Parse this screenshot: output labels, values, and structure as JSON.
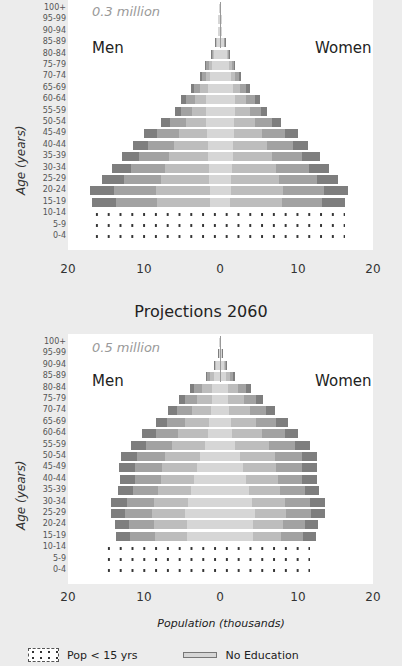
{
  "chart_data": [
    {
      "type": "bar",
      "subtype": "population-pyramid",
      "title": "",
      "scale_note": "0.3 million",
      "left_label": "Men",
      "right_label": "Women",
      "ylabel": "Age (years)",
      "xlabel": "",
      "xlim": [
        -20,
        20
      ],
      "x_ticks": [
        "20",
        "10",
        "0",
        "10",
        "20"
      ],
      "categories": [
        "100+",
        "95-99",
        "90-94",
        "85-89",
        "80-84",
        "75-79",
        "70-74",
        "65-69",
        "60-64",
        "55-59",
        "50-54",
        "45-49",
        "40-44",
        "35-39",
        "30-34",
        "25-29",
        "20-24",
        "15-19",
        "10-14",
        "5-9",
        "0-4"
      ],
      "series": [
        {
          "name": "Men (total)",
          "values": [
            0.1,
            0.2,
            0.3,
            0.7,
            1.2,
            2.0,
            2.6,
            3.8,
            5.1,
            5.9,
            7.8,
            10.0,
            11.4,
            12.9,
            14.2,
            15.5,
            17.1,
            16.8,
            17.0,
            17.0,
            17.0
          ]
        },
        {
          "name": "Women (total)",
          "values": [
            0.1,
            0.2,
            0.3,
            0.7,
            1.3,
            2.0,
            2.7,
            3.9,
            5.3,
            6.2,
            8.0,
            10.2,
            11.6,
            13.1,
            14.3,
            15.5,
            16.8,
            16.4,
            16.4,
            16.4,
            16.4
          ]
        },
        {
          "name": "Men No Education",
          "values": [
            0.1,
            0.2,
            0.3,
            0.5,
            0.8,
            1.1,
            1.3,
            1.6,
            1.9,
            1.9,
            1.8,
            1.7,
            1.6,
            1.6,
            1.5,
            1.4,
            1.3,
            1.3,
            0,
            0,
            0
          ]
        },
        {
          "name": "Women No Education",
          "values": [
            0.1,
            0.2,
            0.3,
            0.5,
            0.9,
            1.2,
            1.4,
            1.7,
            2.0,
            2.0,
            1.9,
            1.8,
            1.7,
            1.7,
            1.6,
            1.5,
            1.4,
            1.3,
            0,
            0,
            0
          ]
        }
      ],
      "pop_under_15_pattern": "dotted"
    },
    {
      "type": "bar",
      "subtype": "population-pyramid",
      "title": "Projections 2060",
      "scale_note": "0.5 million",
      "left_label": "Men",
      "right_label": "Women",
      "ylabel": "Age (years)",
      "xlabel": "Population (thousands)",
      "xlim": [
        -20,
        20
      ],
      "x_ticks": [
        "20",
        "10",
        "0",
        "10",
        "20"
      ],
      "categories": [
        "100+",
        "95-99",
        "90-94",
        "85-89",
        "80-84",
        "75-79",
        "70-74",
        "65-69",
        "60-64",
        "55-59",
        "50-54",
        "45-49",
        "40-44",
        "35-39",
        "30-34",
        "25-29",
        "20-24",
        "15-19",
        "10-14",
        "5-9",
        "0-4"
      ],
      "series": [
        {
          "name": "Men (total)",
          "values": [
            0.1,
            0.3,
            0.8,
            1.9,
            4.0,
            5.4,
            6.8,
            8.4,
            10.2,
            11.7,
            13.0,
            13.3,
            13.2,
            13.4,
            14.3,
            14.4,
            13.8,
            13.7,
            15.4,
            15.2,
            15.0
          ]
        },
        {
          "name": "Women (total)",
          "values": [
            0.1,
            0.3,
            0.9,
            2.0,
            4.1,
            5.7,
            7.3,
            8.9,
            10.3,
            11.9,
            12.8,
            12.8,
            12.7,
            13.0,
            13.8,
            13.8,
            12.9,
            12.6,
            11.8,
            11.6,
            11.4
          ]
        },
        {
          "name": "Men No Education",
          "values": [
            0.1,
            0.2,
            0.5,
            0.8,
            1.0,
            1.1,
            1.2,
            1.4,
            1.6,
            2.0,
            2.6,
            3.0,
            3.4,
            3.8,
            4.2,
            4.6,
            4.4,
            4.3,
            0,
            0,
            0
          ]
        },
        {
          "name": "Women No Education",
          "values": [
            0.1,
            0.2,
            0.5,
            0.8,
            1.0,
            1.1,
            1.2,
            1.4,
            1.6,
            2.0,
            2.6,
            3.0,
            3.4,
            3.8,
            4.2,
            4.6,
            4.4,
            4.3,
            0,
            0,
            0
          ]
        }
      ],
      "pop_under_15_pattern": "dotted"
    }
  ],
  "legend": {
    "items": [
      {
        "label": "Pop < 15 yrs",
        "pattern": "dotted"
      },
      {
        "label": "No Education",
        "pattern": "light-gray-bar"
      }
    ]
  },
  "panels": {
    "top": {
      "scale_note": "0.3 million",
      "men": "Men",
      "women": "Women",
      "y_title": "Age (years)",
      "ticks": [
        "20",
        "10",
        "0",
        "10",
        "20"
      ]
    },
    "bottom": {
      "title": "Projections 2060",
      "scale_note": "0.5 million",
      "men": "Men",
      "women": "Women",
      "y_title": "Age (years)",
      "ticks": [
        "20",
        "10",
        "0",
        "10",
        "20"
      ],
      "x_title": "Population (thousands)"
    }
  },
  "colors": {
    "plot_bg": "#ffffff",
    "page_bg": "#ececec",
    "dark": "#7e7e7e",
    "mid": "#a2a2a2",
    "light": "#bdbdbd",
    "no_education": "#d6d6d6"
  }
}
